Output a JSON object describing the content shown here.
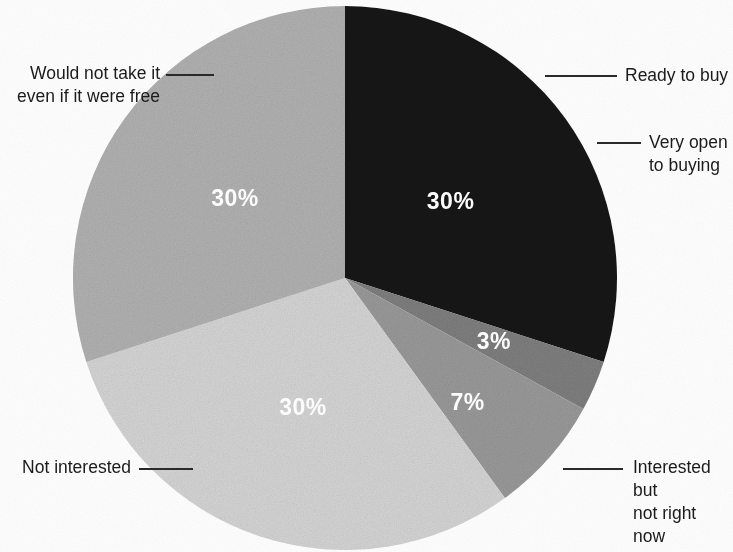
{
  "chart_data": {
    "type": "pie",
    "title": "",
    "subtitle": "",
    "xlabel": "",
    "ylabel": "",
    "legend_position": "callout-labels",
    "grid": false,
    "units": "percent",
    "categories": [
      "Would not take it even if it were free",
      "Ready to buy",
      "Very open to buying",
      "Interested but not right now",
      "Not interested"
    ],
    "values": [
      30,
      3,
      7,
      30,
      30
    ],
    "value_labels": [
      "30%",
      "3%",
      "7%",
      "30%",
      "30%"
    ],
    "colors": [
      "#171717",
      "#7f7f7f",
      "#9a9a9a",
      "#d6d6d6",
      "#b2b2b2"
    ],
    "slices": [
      {
        "label": "Would not take it even if it were free",
        "label_line1": "Would not take it",
        "label_line2": "even if it were free",
        "value": 30,
        "value_label": "30%",
        "color": "#171717",
        "start_angle": 0,
        "end_angle": 108
      },
      {
        "label": "Ready to buy",
        "label_line1": "Ready to buy",
        "label_line2": "",
        "value": 3,
        "value_label": "3%",
        "color": "#7f7f7f",
        "start_angle": 108,
        "end_angle": 118.8
      },
      {
        "label": "Very open to buying",
        "label_line1": "Very open",
        "label_line2": "to buying",
        "value": 7,
        "value_label": "7%",
        "color": "#9a9a9a",
        "start_angle": 118.8,
        "end_angle": 144
      },
      {
        "label": "Interested but not right now",
        "label_line1": "Interested but",
        "label_line2": "not right now",
        "value": 30,
        "value_label": "30%",
        "color": "#d6d6d6",
        "start_angle": 144,
        "end_angle": 252
      },
      {
        "label": "Not interested",
        "label_line1": "Not interested",
        "label_line2": "",
        "value": 30,
        "value_label": "30%",
        "color": "#b2b2b2",
        "start_angle": 252,
        "end_angle": 360
      }
    ]
  },
  "callouts": {
    "would_not_take": "Would not take it\neven if it were free",
    "ready_to_buy": "Ready to buy",
    "very_open": "Very open\nto buying",
    "interested_but": "Interested but\nnot right now",
    "not_interested": "Not interested"
  },
  "values": {
    "would_not_take": "30%",
    "ready_to_buy": "3%",
    "very_open": "7%",
    "interested_but": "30%",
    "not_interested": "30%"
  }
}
